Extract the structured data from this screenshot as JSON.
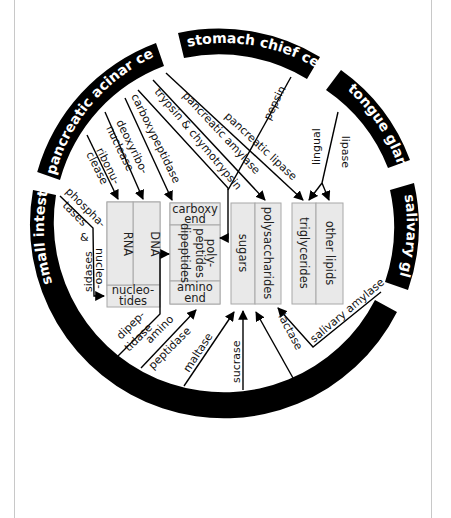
{
  "diagram": {
    "sources": [
      {
        "id": "pancreatic",
        "label": "pancreatic acinar cells"
      },
      {
        "id": "stomach",
        "label": "stomach chief cells"
      },
      {
        "id": "tongue",
        "label": "tongue glands"
      },
      {
        "id": "salivary",
        "label": "salivary glands"
      },
      {
        "id": "small_intestine",
        "label": "small intestine"
      }
    ],
    "enzymes": {
      "ribonuclease": [
        "ribonu-",
        "clease"
      ],
      "deoxyribonuclease": [
        "deoxyribo-",
        "nuclease"
      ],
      "carboxypeptidase": "carboxypeptidase",
      "trypsin": "trypsin & chymotrypsin",
      "pancreatic_amylase": "pancreatic amylase",
      "pancreatic_lipase": "pancreatic lipase",
      "pepsin": "pepsin",
      "lingual_lipase": [
        "lingual",
        "lipase"
      ],
      "salivary_amylase": "salivary amylase",
      "phosphatases": [
        "phospha-",
        "tases",
        "&",
        "nucleo-",
        "sidases"
      ],
      "dipeptidase": [
        "dipep-",
        "tidase"
      ],
      "aminopeptidase": [
        "amino",
        "peptidase"
      ],
      "maltase": "maltase",
      "sucrase": "sucrase",
      "lactase": "lactase"
    },
    "substrates": {
      "nucleic": {
        "rna": "RNA",
        "dna": "DNA",
        "nucleotides": [
          "nucleo-",
          "tides"
        ]
      },
      "protein": {
        "carboxy": [
          "carboxy",
          "end"
        ],
        "dipeptides": "dipeptides",
        "polypeptides": [
          "poly-",
          "peptides"
        ],
        "amino": [
          "amino",
          "end"
        ]
      },
      "carbs": {
        "sugars": "sugars",
        "polysaccharides": "polysaccharides"
      },
      "lipids": {
        "triglycerides": "triglycerides",
        "other": "other lipids"
      }
    },
    "colors": {
      "ring": "#000000",
      "box_fill": "#e9e9e9",
      "box_stroke": "#a8a8a8",
      "frame": "#c8c8c8"
    }
  }
}
